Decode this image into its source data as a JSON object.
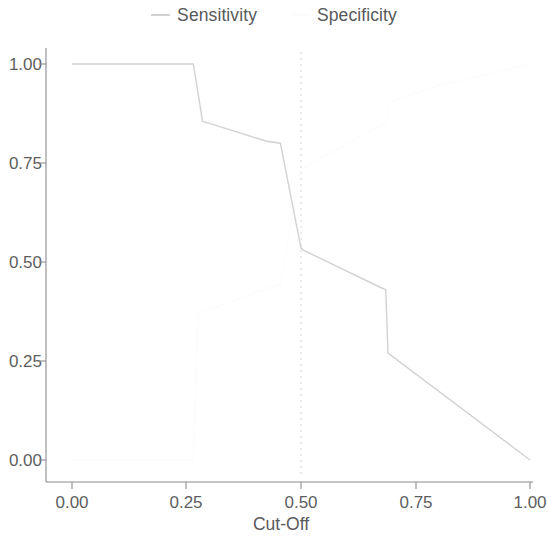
{
  "legend": {
    "position": "top-center",
    "entries": [
      {
        "label": "Sensitivity",
        "color": "#d2d2d2",
        "marker": "line-segment"
      },
      {
        "label": "Specificity",
        "color": "#fcfcfc",
        "marker": "line-segment"
      }
    ]
  },
  "axes": {
    "x_title": "Cut-Off",
    "y_title": "",
    "x_ticks": [
      "0.00",
      "0.25",
      "0.50",
      "0.75",
      "1.00"
    ],
    "y_ticks": [
      "1.00",
      "0.75",
      "0.50",
      "0.25",
      "0.00"
    ]
  },
  "annotations": {
    "reference_line": {
      "axis": "x",
      "value": 0.5,
      "style": "dotted",
      "color": "#e2e2e2"
    }
  },
  "chart_data": {
    "type": "line",
    "title": "",
    "subtitle": "",
    "xlabel": "Cut-Off",
    "ylabel": "",
    "xlim": [
      0.0,
      1.0
    ],
    "ylim": [
      0.0,
      1.0
    ],
    "xticks": [
      0.0,
      0.25,
      0.5,
      0.75,
      1.0
    ],
    "yticks": [
      0.0,
      0.25,
      0.5,
      0.75,
      1.0
    ],
    "grid": false,
    "legend_position": "top-center",
    "reference_lines": [
      {
        "orientation": "vertical",
        "x": 0.5,
        "style": "dotted"
      }
    ],
    "series": [
      {
        "name": "Sensitivity",
        "color": "#d2d2d2",
        "x": [
          0.0,
          0.255,
          0.265,
          0.285,
          0.3,
          0.425,
          0.455,
          0.5,
          0.505,
          0.675,
          0.685,
          0.69,
          1.0
        ],
        "y": [
          1.0,
          1.0,
          1.0,
          0.855,
          0.85,
          0.805,
          0.8,
          0.535,
          0.53,
          0.435,
          0.43,
          0.27,
          0.0
        ]
      },
      {
        "name": "Specificity",
        "color": "#fcfcfc",
        "x": [
          0.0,
          0.255,
          0.265,
          0.275,
          0.455,
          0.5,
          0.675,
          0.685,
          0.695,
          0.8,
          1.0
        ],
        "y": [
          0.0,
          0.0,
          0.0,
          0.37,
          0.445,
          0.735,
          0.845,
          0.85,
          0.905,
          0.945,
          1.0
        ]
      }
    ]
  }
}
